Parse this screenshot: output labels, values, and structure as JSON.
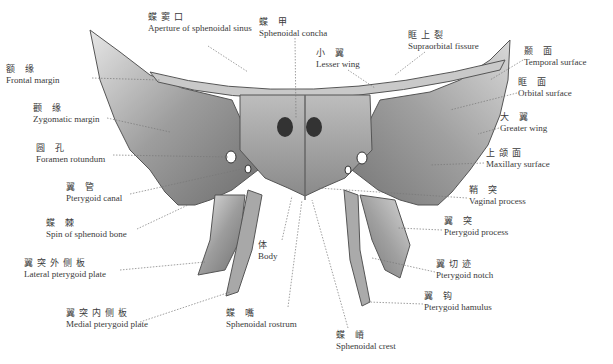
{
  "diagram": {
    "labels": [
      {
        "id": "frontal-margin",
        "zh": "额 缘",
        "en": "Frontal margin",
        "x": 6,
        "y": 64
      },
      {
        "id": "aperture-sphenoidal-sinus",
        "zh": "蝶窦口",
        "en": "Aperture of sphenoidal sinus",
        "x": 148,
        "y": 38
      },
      {
        "id": "sphenoidal-concha",
        "zh": "蝶 甲",
        "en": "Sphenoidal concha",
        "x": 259,
        "y": 17
      },
      {
        "id": "lesser-wing",
        "zh": "小 翼",
        "en": "Lesser wing",
        "x": 316,
        "y": 48
      },
      {
        "id": "supraorbital-fissure",
        "zh": "眶上裂",
        "en": "Supraorbital fissure",
        "x": 408,
        "y": 30
      },
      {
        "id": "temporal-surface",
        "zh": "颞 面",
        "en": "Temporal surface",
        "x": 524,
        "y": 46
      },
      {
        "id": "zygomatic-margin",
        "zh": "颧 缘",
        "en": "Zygomatic margin",
        "x": 33,
        "y": 103
      },
      {
        "id": "orbital-surface",
        "zh": "眶 面",
        "en": "Orbital surface",
        "x": 518,
        "y": 77
      },
      {
        "id": "greater-wing",
        "zh": "大 翼",
        "en": "Greater wing",
        "x": 500,
        "y": 112
      },
      {
        "id": "foramen-rotundum",
        "zh": "圆 孔",
        "en": "Foramen rotundum",
        "x": 36,
        "y": 143
      },
      {
        "id": "maxillary-surface",
        "zh": "上颌面",
        "en": "Maxillary surface",
        "x": 486,
        "y": 148
      },
      {
        "id": "pterygoid-canal",
        "zh": "翼 管",
        "en": "Pterygoid canal",
        "x": 66,
        "y": 182
      },
      {
        "id": "vaginal-process",
        "zh": "鞘 突",
        "en": "Vaginal process",
        "x": 469,
        "y": 185
      },
      {
        "id": "spin-of-sphenoid-bone",
        "zh": "蝶 棘",
        "en": "Spin of sphenoid bone",
        "x": 46,
        "y": 218
      },
      {
        "id": "pterygoid-process",
        "zh": "翼 突",
        "en": "Pterygoid process",
        "x": 444,
        "y": 216
      },
      {
        "id": "body",
        "zh": "体",
        "en": "Body",
        "x": 258,
        "y": 240
      },
      {
        "id": "lateral-pterygoid-plate",
        "zh": "翼突外侧板",
        "en": "Lateral pterygoid plate",
        "x": 24,
        "y": 258
      },
      {
        "id": "pterygoid-notch",
        "zh": "翼切迹",
        "en": "Pterygoid notch",
        "x": 436,
        "y": 259
      },
      {
        "id": "pterygoid-hamulus",
        "zh": "翼 钩",
        "en": "Pterygoid hamulus",
        "x": 424,
        "y": 291
      },
      {
        "id": "medial-pterygoid-plate",
        "zh": "翼突内侧板",
        "en": "Medial pterygoid plate",
        "x": 66,
        "y": 308
      },
      {
        "id": "sphenoidal-rostrum",
        "zh": "蝶 嘴",
        "en": "Sphenoidal rostrum",
        "x": 226,
        "y": 308
      },
      {
        "id": "sphenoidal-crest",
        "zh": "蝶 嵴",
        "en": "Sphenoidal crest",
        "x": 336,
        "y": 330
      }
    ]
  }
}
